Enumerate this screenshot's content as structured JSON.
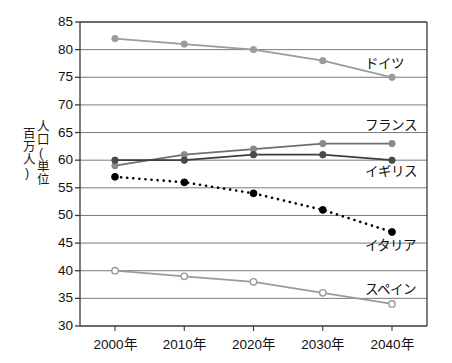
{
  "chart_data": {
    "type": "line",
    "title": "",
    "xlabel": "",
    "ylabel": "人口(単位 百万人)",
    "ylabel_chars": "人口(単位\n百万人)",
    "categories": [
      "2000年",
      "2010年",
      "2020年",
      "2030年",
      "2040年"
    ],
    "x_values": [
      2000,
      2010,
      2020,
      2030,
      2040
    ],
    "ylim": [
      30,
      85
    ],
    "ytick_step": 5,
    "yticks": [
      85,
      80,
      75,
      70,
      65,
      60,
      55,
      50,
      45,
      40,
      35,
      30
    ],
    "ytick_labels": [
      "85",
      "80",
      "75",
      "70",
      "65",
      "60",
      "55",
      "50",
      "45",
      "40",
      "35",
      "30"
    ],
    "grid": true,
    "grid_axis": "y",
    "legend_position": "right-inline",
    "series": [
      {
        "name": "ドイツ",
        "values": [
          82,
          81,
          80,
          78,
          75
        ],
        "color": "#9b9b9b",
        "line_style": "solid",
        "marker": "filled-circle",
        "marker_color": "#9b9b9b",
        "label_x": 2040,
        "label_y": 77.2
      },
      {
        "name": "フランス",
        "values": [
          59,
          61,
          62,
          63,
          63
        ],
        "color": "#6e6e6e",
        "line_style": "solid",
        "marker": "filled-circle",
        "marker_color": "#8a8a8a",
        "label_x": 2040,
        "label_y": 66.0
      },
      {
        "name": "イギリス",
        "values": [
          60,
          60,
          61,
          61,
          60
        ],
        "color": "#3d3d3d",
        "line_style": "solid",
        "marker": "filled-circle",
        "marker_color": "#4a4a4a",
        "label_x": 2040,
        "label_y": 57.6
      },
      {
        "name": "イタリア",
        "values": [
          57,
          56,
          54,
          51,
          47
        ],
        "color": "#000000",
        "line_style": "dotted",
        "marker": "filled-circle",
        "marker_color": "#000000",
        "label_x": 2040,
        "label_y": 44.3
      },
      {
        "name": "スペイン",
        "values": [
          40,
          39,
          38,
          36,
          34
        ],
        "color": "#9b9b9b",
        "line_style": "solid",
        "marker": "open-circle",
        "marker_color": "#9b9b9b",
        "label_x": 2040,
        "label_y": 36.4
      }
    ],
    "colors": {
      "axis": "#3a3a3a",
      "grid": "#7a7a7a",
      "text": "#111111",
      "background": "#ffffff"
    }
  }
}
